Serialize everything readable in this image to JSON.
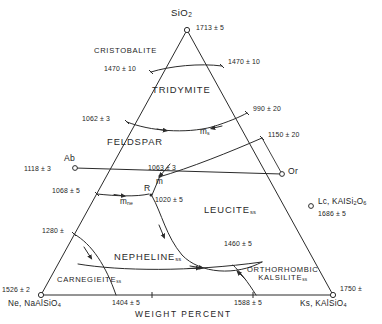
{
  "diagram": {
    "title_axis": "WEIGHT  PERCENT",
    "system": "SiO2 - NaAlSiO4 - KAlSiO4",
    "apex": {
      "label_html": "SiO<sub>2</sub>",
      "temp": "1713 ± 5"
    },
    "corners": [
      {
        "name": "ne-corner",
        "label_html": "Ne, NaAlSiO<sub>4</sub>",
        "temp": "1526 ± 2"
      },
      {
        "name": "ks-corner",
        "label_html": "Ks, KAlSiO<sub>4</sub>",
        "temp": "1750 ±"
      }
    ],
    "fields": [
      {
        "name": "cristobalite",
        "label": "CRISTOBALITE"
      },
      {
        "name": "tridymite",
        "label": "TRIDYMITE"
      },
      {
        "name": "feldspar",
        "label": "FELDSPAR"
      },
      {
        "name": "leucite-ss",
        "label": "LEUCITE",
        "subscript": "ss"
      },
      {
        "name": "nepheline-ss",
        "label": "NEPHELINE",
        "subscript": "ss"
      },
      {
        "name": "carnegieite-ss",
        "label": "CARNEGIEITE",
        "subscript": "ss"
      },
      {
        "name": "orthorhombic-kalsilite-ss",
        "line1": "ORTHORHOMBIC",
        "line2": "KALSILITE",
        "subscript": "ss"
      }
    ],
    "points": [
      {
        "name": "ab",
        "label": "Ab",
        "temp": "1118 ± 3"
      },
      {
        "name": "or",
        "label": "Or",
        "temp": ""
      },
      {
        "name": "lc",
        "label_html": "Lc, KAISi<sub>2</sub>O<sub>6</sub>",
        "temp": "1686 ± 5"
      },
      {
        "name": "m",
        "label": "m",
        "temp": "1063 ± 3"
      },
      {
        "name": "ms",
        "label": "m",
        "subscript": "s",
        "temp": ""
      },
      {
        "name": "mne",
        "label": "m",
        "subscript": "ne",
        "temp": ""
      },
      {
        "name": "r",
        "label": "R",
        "temp": "1020 ± 5"
      }
    ],
    "temperatures": [
      {
        "name": "temp-cristobalite-tridymite-left",
        "value": "1470 ± 10"
      },
      {
        "name": "temp-cristobalite-tridymite-right",
        "value": "1470 ± 10"
      },
      {
        "name": "temp-tridymite-feldspar-left",
        "value": "1062 ± 3"
      },
      {
        "name": "temp-tridymite-right",
        "value": "990 ± 20"
      },
      {
        "name": "temp-feldspar-leucite-right",
        "value": "1150 ± 20"
      },
      {
        "name": "temp-feldspar-nepheline-left",
        "value": "1068 ± 5"
      },
      {
        "name": "temp-nepheline-carnegieite",
        "value": "1280 ±"
      },
      {
        "name": "temp-leucite-kalsilite",
        "value": "1460 ± 5"
      },
      {
        "name": "temp-base-ne-side",
        "value": "1404 ± 5"
      },
      {
        "name": "temp-base-ks-side",
        "value": "1588 ± 5"
      }
    ],
    "colors": {
      "line": "#2b2b2b",
      "text": "#1d1d1d",
      "background": "#ffffff"
    }
  }
}
